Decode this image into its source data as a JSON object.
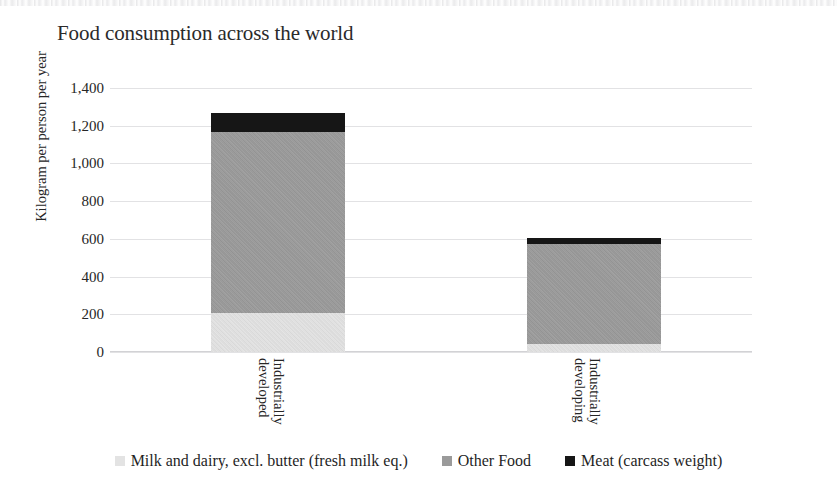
{
  "chart_data": {
    "type": "bar",
    "subtype": "stacked-column",
    "title": "Food consumption across the world",
    "xlabel": "",
    "ylabel": "Kilogram per person per year",
    "categories": [
      "Industrially developed",
      "Industrially developing"
    ],
    "category_lines": [
      [
        "Industrially",
        "developed"
      ],
      [
        "Industrially",
        "developing"
      ]
    ],
    "series": [
      {
        "name": "Milk and dairy, excl. butter (fresh milk eq.)",
        "color": "#e3e3e3",
        "values": [
          205,
          45
        ]
      },
      {
        "name": "Other Food",
        "color": "#9a9a9a",
        "values": [
          960,
          530
        ]
      },
      {
        "name": "Meat (carcass weight)",
        "color": "#161616",
        "values": [
          100,
          30
        ]
      }
    ],
    "totals": [
      1265,
      605
    ],
    "ylim": [
      0,
      1400
    ],
    "yticks": [
      0,
      200,
      400,
      600,
      800,
      1000,
      1200,
      1400
    ],
    "ytick_labels": [
      "0",
      "200",
      "400",
      "600",
      "800",
      "1,000",
      "1,200",
      "1,400"
    ],
    "grid": true,
    "grid_axis": "y",
    "legend_position": "bottom"
  },
  "colors": {
    "background": "#ffffff",
    "text": "#262626",
    "gridline": "#e2e2e4",
    "axis": "#d2d2d5"
  }
}
